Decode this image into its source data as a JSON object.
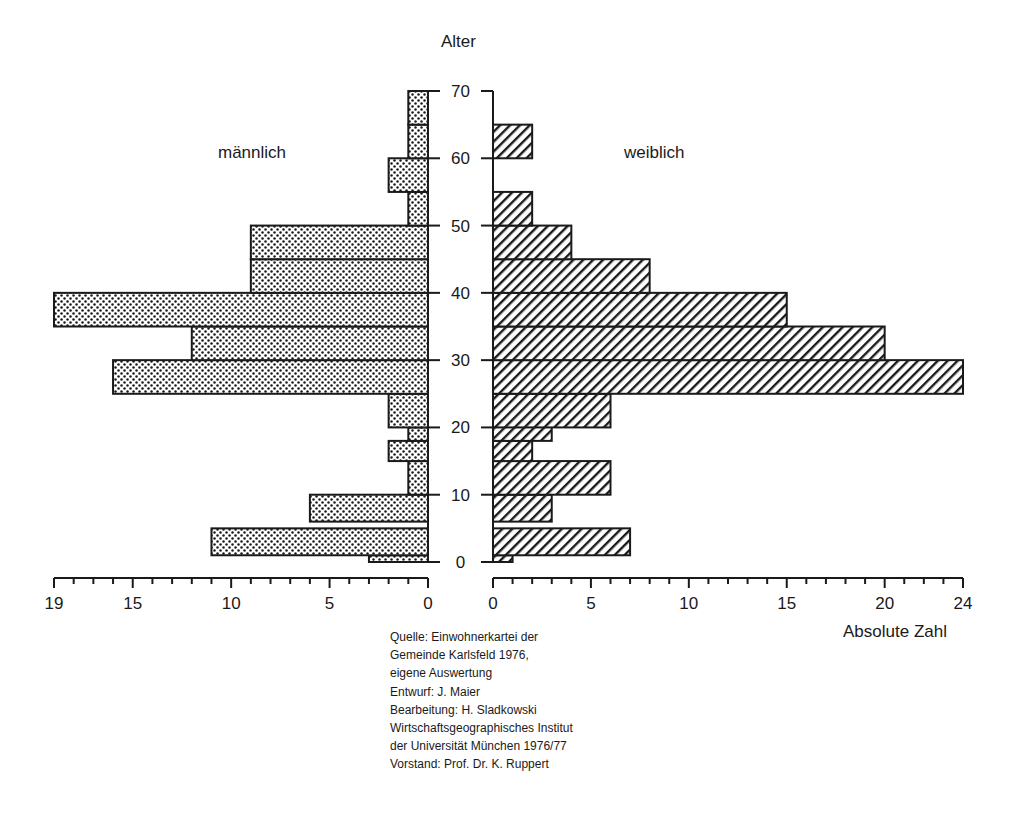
{
  "chart_data": {
    "type": "bar",
    "orientation": "horizontal",
    "subtype": "population-pyramid",
    "y_axis_label": "Alter",
    "x_axis_label": "Absolute Zahl",
    "y_ticks": [
      0,
      10,
      20,
      30,
      40,
      50,
      60,
      70
    ],
    "y_range": [
      0,
      70
    ],
    "male": {
      "label": "männlich",
      "pattern": "dotted",
      "x_ticks": [
        0,
        5,
        10,
        15,
        19
      ],
      "x_range": [
        0,
        19
      ],
      "bands": [
        {
          "from": 0,
          "to": 1,
          "value": 3
        },
        {
          "from": 1,
          "to": 5,
          "value": 11
        },
        {
          "from": 6,
          "to": 10,
          "value": 6
        },
        {
          "from": 10,
          "to": 15,
          "value": 1
        },
        {
          "from": 15,
          "to": 18,
          "value": 2
        },
        {
          "from": 18,
          "to": 20,
          "value": 1
        },
        {
          "from": 20,
          "to": 25,
          "value": 2
        },
        {
          "from": 25,
          "to": 30,
          "value": 16
        },
        {
          "from": 30,
          "to": 35,
          "value": 12
        },
        {
          "from": 35,
          "to": 40,
          "value": 19
        },
        {
          "from": 40,
          "to": 45,
          "value": 9
        },
        {
          "from": 45,
          "to": 50,
          "value": 9
        },
        {
          "from": 50,
          "to": 55,
          "value": 1
        },
        {
          "from": 55,
          "to": 60,
          "value": 2
        },
        {
          "from": 60,
          "to": 65,
          "value": 1
        },
        {
          "from": 65,
          "to": 70,
          "value": 1
        }
      ]
    },
    "female": {
      "label": "weiblich",
      "pattern": "hatched",
      "x_ticks": [
        0,
        5,
        10,
        15,
        20,
        24
      ],
      "x_range": [
        0,
        24
      ],
      "bands": [
        {
          "from": 0,
          "to": 1,
          "value": 1
        },
        {
          "from": 1,
          "to": 5,
          "value": 7
        },
        {
          "from": 6,
          "to": 10,
          "value": 3
        },
        {
          "from": 10,
          "to": 15,
          "value": 6
        },
        {
          "from": 15,
          "to": 18,
          "value": 2
        },
        {
          "from": 18,
          "to": 21,
          "value": 3
        },
        {
          "from": 20,
          "to": 25,
          "value": 6
        },
        {
          "from": 25,
          "to": 30,
          "value": 24
        },
        {
          "from": 30,
          "to": 35,
          "value": 20
        },
        {
          "from": 35,
          "to": 40,
          "value": 15
        },
        {
          "from": 40,
          "to": 45,
          "value": 8
        },
        {
          "from": 45,
          "to": 50,
          "value": 4
        },
        {
          "from": 50,
          "to": 55,
          "value": 2
        },
        {
          "from": 55,
          "to": 60,
          "value": 0
        },
        {
          "from": 60,
          "to": 65,
          "value": 2
        },
        {
          "from": 65,
          "to": 70,
          "value": 0
        }
      ]
    },
    "legend": "none",
    "grid": false
  },
  "labels": {
    "y_axis_title": "Alter",
    "male_title": "männlich",
    "female_title": "weiblich",
    "x_axis_title": "Absolute Zahl"
  },
  "source": {
    "lines": [
      "Quelle: Einwohnerkartei der",
      "Gemeinde Karlsfeld 1976,",
      "eigene Auswertung",
      "Entwurf: J. Maier",
      "Bearbeitung: H. Sladkowski",
      "Wirtschaftsgeographisches Institut",
      "der Universität München 1976/77",
      "Vorstand: Prof. Dr. K. Ruppert"
    ]
  },
  "colors": {
    "ink": "#1a1a1a",
    "background": "#ffffff"
  }
}
